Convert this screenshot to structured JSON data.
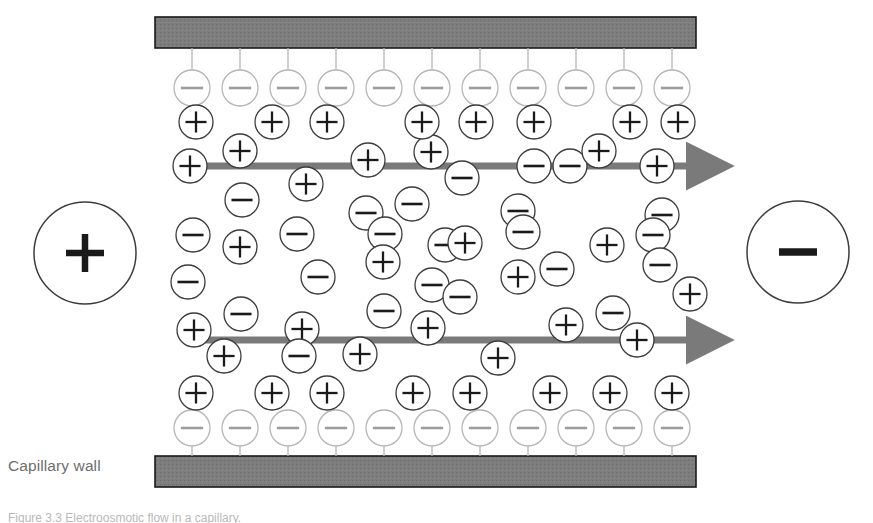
{
  "figure": {
    "title": "Electroosmotic flow in a capillary",
    "wall_label": "Capillary wall",
    "caption": "Figure 3.3   Electroosmotic flow in a capillary.",
    "background_color": "#ffffff",
    "wall_fill": "#7d7d7d",
    "wall_stroke": "#1a1a1a",
    "arrow_color": "#7a7a7a",
    "bulk_ion_stroke": "#3c3c3c",
    "surface_ion_stroke": "#b5b5b5",
    "electrode_stroke": "#3c3c3c",
    "sign_color": "#1a1a1a"
  },
  "electrodes": [
    {
      "name": "anode",
      "sign": "+",
      "cx": 85,
      "cy": 253,
      "r": 51
    },
    {
      "name": "cathode",
      "sign": "−",
      "cx": 798,
      "cy": 252,
      "r": 51
    }
  ],
  "walls": [
    {
      "name": "top-capillary-wall",
      "x": 155,
      "y": 17,
      "width": 541,
      "height": 31
    },
    {
      "name": "bottom-capillary-wall",
      "x": 155,
      "y": 456,
      "width": 541,
      "height": 31
    }
  ],
  "flow_arrows": [
    {
      "name": "upper-flow-arrow",
      "x1": 186,
      "x2": 706,
      "y": 166,
      "direction": "right",
      "thickness": 7
    },
    {
      "name": "lower-flow-arrow",
      "x1": 186,
      "x2": 706,
      "y": 340,
      "direction": "right",
      "thickness": 7
    }
  ],
  "surface_ions": {
    "sign": "−",
    "radius": 18,
    "stem_length_top": 18,
    "stem_length_bottom": 18,
    "top_row": {
      "cy": 88,
      "cx": [
        192,
        240,
        288,
        336,
        384,
        432,
        480,
        528,
        576,
        624,
        672
      ]
    },
    "bottom_row": {
      "cy": 428,
      "cx": [
        192,
        240,
        288,
        336,
        384,
        432,
        480,
        528,
        576,
        624,
        672
      ]
    }
  },
  "counter_ion_rows": [
    {
      "name": "top-counter-ion-row",
      "sign": "+",
      "cy": 122,
      "radius": 17,
      "cx": [
        196,
        272,
        327,
        422,
        476,
        534,
        630,
        678
      ]
    },
    {
      "name": "bottom-counter-ion-row",
      "sign": "+",
      "cy": 393,
      "radius": 17,
      "cx": [
        196,
        272,
        327,
        413,
        470,
        550,
        610,
        672
      ]
    }
  ],
  "bulk_ions": [
    {
      "sign": "+",
      "cx": 190,
      "cy": 166,
      "r": 17
    },
    {
      "sign": "+",
      "cx": 240,
      "cy": 151,
      "r": 17
    },
    {
      "sign": "+",
      "cx": 368,
      "cy": 160,
      "r": 17
    },
    {
      "sign": "+",
      "cx": 431,
      "cy": 152,
      "r": 17
    },
    {
      "sign": "−",
      "cx": 462,
      "cy": 178,
      "r": 17
    },
    {
      "sign": "−",
      "cx": 534,
      "cy": 166,
      "r": 17
    },
    {
      "sign": "−",
      "cx": 570,
      "cy": 166,
      "r": 17
    },
    {
      "sign": "+",
      "cx": 599,
      "cy": 151,
      "r": 17
    },
    {
      "sign": "+",
      "cx": 657,
      "cy": 166,
      "r": 17
    },
    {
      "sign": "+",
      "cx": 306,
      "cy": 184,
      "r": 17
    },
    {
      "sign": "−",
      "cx": 242,
      "cy": 200,
      "r": 17
    },
    {
      "sign": "−",
      "cx": 366,
      "cy": 213,
      "r": 17
    },
    {
      "sign": "−",
      "cx": 412,
      "cy": 204,
      "r": 17
    },
    {
      "sign": "−",
      "cx": 518,
      "cy": 211,
      "r": 17
    },
    {
      "sign": "−",
      "cx": 662,
      "cy": 215,
      "r": 17
    },
    {
      "sign": "−",
      "cx": 193,
      "cy": 235,
      "r": 17
    },
    {
      "sign": "+",
      "cx": 240,
      "cy": 247,
      "r": 17
    },
    {
      "sign": "−",
      "cx": 297,
      "cy": 234,
      "r": 17
    },
    {
      "sign": "−",
      "cx": 385,
      "cy": 234,
      "r": 17
    },
    {
      "sign": "−",
      "cx": 445,
      "cy": 245,
      "r": 17
    },
    {
      "sign": "+",
      "cx": 465,
      "cy": 243,
      "r": 17
    },
    {
      "sign": "−",
      "cx": 523,
      "cy": 232,
      "r": 17
    },
    {
      "sign": "+",
      "cx": 607,
      "cy": 245,
      "r": 17
    },
    {
      "sign": "−",
      "cx": 653,
      "cy": 235,
      "r": 17
    },
    {
      "sign": "−",
      "cx": 188,
      "cy": 282,
      "r": 17
    },
    {
      "sign": "−",
      "cx": 318,
      "cy": 277,
      "r": 17
    },
    {
      "sign": "+",
      "cx": 383,
      "cy": 262,
      "r": 17
    },
    {
      "sign": "−",
      "cx": 432,
      "cy": 285,
      "r": 17
    },
    {
      "sign": "+",
      "cx": 518,
      "cy": 277,
      "r": 17
    },
    {
      "sign": "−",
      "cx": 557,
      "cy": 269,
      "r": 17
    },
    {
      "sign": "−",
      "cx": 660,
      "cy": 265,
      "r": 17
    },
    {
      "sign": "+",
      "cx": 690,
      "cy": 294,
      "r": 17
    },
    {
      "sign": "−",
      "cx": 241,
      "cy": 314,
      "r": 17
    },
    {
      "sign": "−",
      "cx": 384,
      "cy": 311,
      "r": 17
    },
    {
      "sign": "−",
      "cx": 460,
      "cy": 297,
      "r": 17
    },
    {
      "sign": "−",
      "cx": 613,
      "cy": 313,
      "r": 17
    },
    {
      "sign": "+",
      "cx": 194,
      "cy": 330,
      "r": 17
    },
    {
      "sign": "+",
      "cx": 302,
      "cy": 329,
      "r": 17
    },
    {
      "sign": "+",
      "cx": 428,
      "cy": 328,
      "r": 17
    },
    {
      "sign": "+",
      "cx": 566,
      "cy": 325,
      "r": 17
    },
    {
      "sign": "+",
      "cx": 637,
      "cy": 340,
      "r": 17
    },
    {
      "sign": "+",
      "cx": 224,
      "cy": 356,
      "r": 17
    },
    {
      "sign": "−",
      "cx": 299,
      "cy": 356,
      "r": 17
    },
    {
      "sign": "+",
      "cx": 360,
      "cy": 354,
      "r": 17
    },
    {
      "sign": "+",
      "cx": 498,
      "cy": 358,
      "r": 17
    }
  ]
}
